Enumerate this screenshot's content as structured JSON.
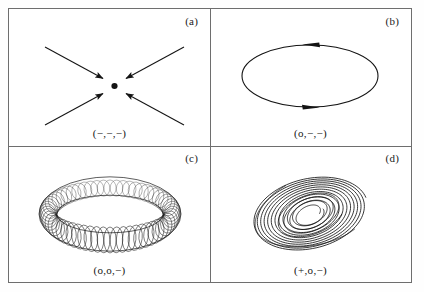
{
  "figure": {
    "background_color": "#ffffff",
    "frame_color": "#6e6e6e",
    "ink_color": "#141414",
    "panels": [
      {
        "letter": "(a)",
        "caption": "(−,−,−)",
        "attractor_name": "fixed-point-attractor",
        "description": "point attractor with four converging arrows"
      },
      {
        "letter": "(b)",
        "caption": "(o,−,−)",
        "attractor_name": "limit-cycle-attractor",
        "description": "closed ellipse orbit with two direction arrowheads"
      },
      {
        "letter": "(c)",
        "caption": "(o,o,−)",
        "attractor_name": "torus-attractor",
        "description": "quasi-periodic torus drawn as a mesh of circles"
      },
      {
        "letter": "(d)",
        "caption": "(+,o,−)",
        "attractor_name": "strange-chaotic-attractor",
        "description": "chaotic spiral attractor with nested loops"
      }
    ]
  },
  "chart_data": {
    "type": "scatter",
    "title": "",
    "xlabel": "",
    "ylabel": "",
    "grid": false,
    "legend_position": "none",
    "panels": [
      {
        "id": "a",
        "label": "(a)",
        "lyapunov_signature": [
          "-",
          "-",
          "-"
        ],
        "type": "fixed point",
        "fixed_point": {
          "x": 105,
          "y": 76
        },
        "arrows": [
          {
            "x1": 36,
            "y1": 38,
            "x2": 95,
            "y2": 70,
            "direction": "inward"
          },
          {
            "x1": 175,
            "y1": 38,
            "x2": 116,
            "y2": 70,
            "direction": "inward"
          },
          {
            "x1": 36,
            "y1": 116,
            "x2": 95,
            "y2": 84,
            "direction": "inward"
          },
          {
            "x1": 175,
            "y1": 116,
            "x2": 116,
            "y2": 84,
            "direction": "inward"
          }
        ]
      },
      {
        "id": "b",
        "label": "(b)",
        "lyapunov_signature": [
          "o",
          "-",
          "-"
        ],
        "type": "limit cycle",
        "ellipse": {
          "cx": 100,
          "cy": 67,
          "rx": 68,
          "ry": 31
        },
        "flow_direction": "counterclockwise",
        "arrowheads": [
          {
            "position": "top",
            "points": "left"
          },
          {
            "position": "bottom",
            "points": "right"
          }
        ]
      },
      {
        "id": "c",
        "label": "(c)",
        "lyapunov_signature": [
          "o",
          "o",
          "-"
        ],
        "type": "torus",
        "torus": {
          "cx": 101,
          "cy": 68,
          "ring_rx": 62,
          "ring_ry": 26,
          "tube_r": 18,
          "tube_count": 60
        }
      },
      {
        "id": "d",
        "label": "(d)",
        "lyapunov_signature": [
          "+",
          "o",
          "-"
        ],
        "type": "strange attractor",
        "spiral": {
          "cx": 100,
          "cy": 68,
          "rotation_deg": -22,
          "loop_count": 11,
          "max_rx": 58,
          "max_ry": 36,
          "min_rx": 14,
          "min_ry": 9
        }
      }
    ]
  }
}
